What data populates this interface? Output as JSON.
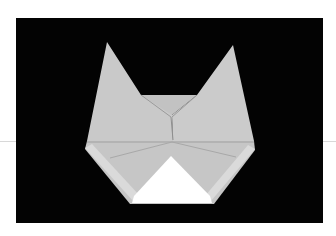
{
  "image": {
    "subject": "origami cat face",
    "description": "Folded gray paper cat head with two pointed ears and a white triangular muzzle, photographed on a black background",
    "colors": {
      "background": "#030303",
      "paper": "#c8c8c8",
      "paper_shadow": "#b4b4b4",
      "paper_light": "#d6d6d6",
      "muzzle": "#ffffff",
      "page": "#ffffff"
    }
  }
}
